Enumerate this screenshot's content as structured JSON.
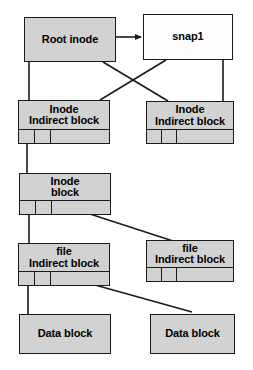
{
  "diagram": {
    "colors": {
      "node_fill_gray": "#d2d2d2",
      "node_fill_white": "#fdfdfd",
      "stroke": "#1a1a1a",
      "background": "#ffffff"
    },
    "nodes": [
      {
        "id": "root-inode",
        "name": "root-inode-node",
        "line1": "Root inode",
        "line2": "",
        "fill": "gray",
        "x": 24,
        "y": 17,
        "w": 92,
        "h": 45,
        "cells": 0
      },
      {
        "id": "snap1",
        "name": "snap1-node",
        "line1": "snap1",
        "line2": "",
        "fill": "white",
        "x": 143,
        "y": 14,
        "w": 90,
        "h": 46,
        "cells": 0
      },
      {
        "id": "inode-indirect-left",
        "name": "inode-indirect-block-left-node",
        "line1": "Inode",
        "line2": "Indirect block",
        "fill": "gray",
        "x": 18,
        "y": 100,
        "w": 92,
        "h": 44,
        "cells": 3,
        "cell_widths": [
          16,
          16,
          58
        ]
      },
      {
        "id": "inode-indirect-right",
        "name": "inode-indirect-block-right-node",
        "line1": "Inode",
        "line2": "Indirect block",
        "fill": "gray",
        "x": 146,
        "y": 101,
        "w": 88,
        "h": 43,
        "cells": 3,
        "cell_widths": [
          15,
          15,
          56
        ]
      },
      {
        "id": "inode-block",
        "name": "inode-block-node",
        "line1": "Inode",
        "line2": "block",
        "fill": "gray",
        "x": 19,
        "y": 173,
        "w": 92,
        "h": 42,
        "cells": 3,
        "cell_widths": [
          16,
          16,
          58
        ]
      },
      {
        "id": "file-indirect-left",
        "name": "file-indirect-block-left-node",
        "line1": "file",
        "line2": "Indirect block",
        "fill": "gray",
        "x": 18,
        "y": 243,
        "w": 92,
        "h": 43,
        "cells": 3,
        "cell_widths": [
          16,
          16,
          58
        ]
      },
      {
        "id": "file-indirect-right",
        "name": "file-indirect-block-right-node",
        "line1": "file",
        "line2": "Indirect block",
        "fill": "gray",
        "x": 146,
        "y": 240,
        "w": 88,
        "h": 42,
        "cells": 3,
        "cell_widths": [
          15,
          15,
          56
        ]
      },
      {
        "id": "data-block-left",
        "name": "data-block-left-node",
        "line1": "Data block",
        "line2": "",
        "fill": "gray",
        "x": 19,
        "y": 314,
        "w": 92,
        "h": 40,
        "cells": 0
      },
      {
        "id": "data-block-right",
        "name": "data-block-right-node",
        "line1": "Data block",
        "line2": "",
        "fill": "gray",
        "x": 150,
        "y": 314,
        "w": 85,
        "h": 40,
        "cells": 0
      }
    ],
    "edges": [
      {
        "name": "edge-root-inode-to-snap1",
        "from": "root-inode",
        "to": "snap1",
        "kind": "arrow",
        "x1": 116,
        "y1": 37,
        "x2": 141,
        "y2": 37
      },
      {
        "name": "edge-root-inode-to-inode-indirect-left",
        "from": "root-inode",
        "to": "inode-indirect-left",
        "kind": "line",
        "x1": 29,
        "y1": 62,
        "x2": 29,
        "y2": 100
      },
      {
        "name": "edge-root-inode-to-inode-indirect-right",
        "from": "root-inode",
        "to": "inode-indirect-right",
        "kind": "line",
        "x1": 103,
        "y1": 62,
        "x2": 168,
        "y2": 101
      },
      {
        "name": "edge-snap1-to-inode-indirect-left",
        "from": "snap1",
        "to": "inode-indirect-left",
        "kind": "line",
        "x1": 166,
        "y1": 60,
        "x2": 100,
        "y2": 100
      },
      {
        "name": "edge-snap1-to-inode-indirect-right",
        "from": "snap1",
        "to": "inode-indirect-right",
        "kind": "line",
        "x1": 223,
        "y1": 60,
        "x2": 223,
        "y2": 101
      },
      {
        "name": "edge-inode-indirect-left-to-inode-block",
        "from": "inode-indirect-left",
        "to": "inode-block",
        "kind": "line",
        "x1": 27,
        "y1": 144,
        "x2": 27,
        "y2": 173
      },
      {
        "name": "edge-inode-block-to-file-indirect-left",
        "from": "inode-block",
        "to": "file-indirect-left",
        "kind": "line",
        "x1": 29,
        "y1": 215,
        "x2": 29,
        "y2": 243
      },
      {
        "name": "edge-inode-block-to-file-indirect-right",
        "from": "inode-block",
        "to": "file-indirect-right",
        "kind": "line",
        "x1": 53,
        "y1": 202,
        "x2": 173,
        "y2": 241
      },
      {
        "name": "edge-file-indirect-left-to-data-block-left",
        "from": "file-indirect-left",
        "to": "data-block-left",
        "kind": "line",
        "x1": 28,
        "y1": 286,
        "x2": 28,
        "y2": 314
      },
      {
        "name": "edge-file-indirect-left-to-data-block-right",
        "from": "file-indirect-left",
        "to": "data-block-right",
        "kind": "line",
        "x1": 52,
        "y1": 273,
        "x2": 192,
        "y2": 312
      }
    ]
  }
}
